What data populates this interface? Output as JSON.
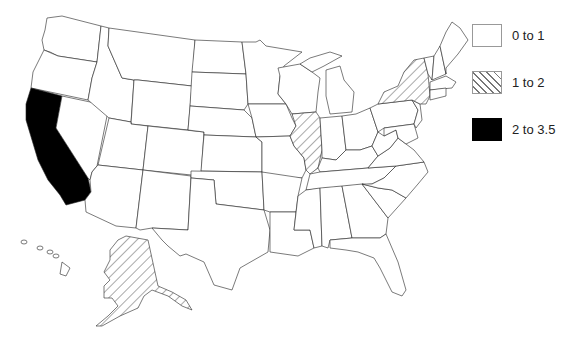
{
  "map": {
    "type": "choropleth",
    "region": "United States (by state, incl. Alaska and Hawaii insets)",
    "legend": {
      "items": [
        {
          "label": "0 to 1",
          "pattern": "white",
          "color": "#ffffff"
        },
        {
          "label": "1 to 2",
          "pattern": "diagonal-hatch",
          "color": "#777777"
        },
        {
          "label": "2 to 3.5",
          "pattern": "solid",
          "color": "#000000"
        }
      ]
    },
    "categories": {
      "2 to 3.5": [
        "California"
      ],
      "1 to 2": [
        "New York",
        "Illinois",
        "Alaska"
      ],
      "0 to 1": [
        "All other states including Hawaii"
      ]
    }
  }
}
